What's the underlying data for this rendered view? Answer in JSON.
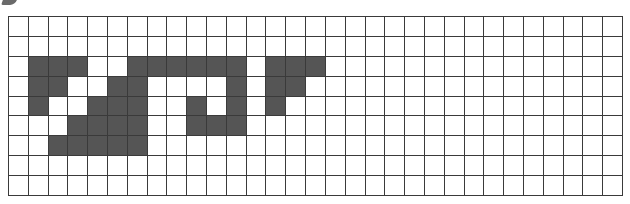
{
  "grid": {
    "rows": 9,
    "cols": 31,
    "colors": {
      "filled": "#555555",
      "empty": "#ffffff",
      "line": "#3a3a3a"
    },
    "filled_cells": {
      "2": [
        1,
        2,
        3,
        6,
        7,
        8,
        9,
        10,
        11,
        13,
        14,
        15
      ],
      "3": [
        1,
        2,
        5,
        6,
        11,
        13,
        14
      ],
      "4": [
        1,
        4,
        5,
        6,
        9,
        11,
        13
      ],
      "5": [
        3,
        4,
        5,
        6,
        9,
        10,
        11
      ],
      "6": [
        2,
        3,
        4,
        5,
        6
      ]
    }
  }
}
